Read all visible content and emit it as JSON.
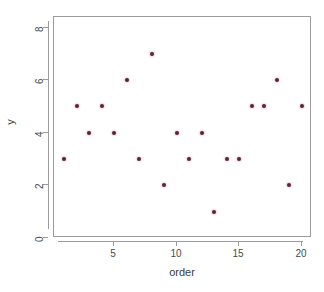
{
  "chart_data": {
    "type": "scatter",
    "title": "",
    "xlabel": "order",
    "ylabel": "y",
    "xlim": [
      0.2,
      20.8
    ],
    "ylim": [
      0,
      8.4
    ],
    "grid": false,
    "legend": null,
    "point_color": "#5e2239",
    "axis_color": "#9c9c9c",
    "background_color": "#ffffff",
    "x_ticks": [
      5,
      10,
      15,
      20
    ],
    "y_ticks": [
      0,
      2,
      4,
      6,
      8
    ],
    "x_tick_labels": [
      "5",
      "10",
      "15",
      "20"
    ],
    "y_tick_labels": [
      "0",
      "2",
      "4",
      "6",
      "8"
    ],
    "x": [
      1,
      2,
      3,
      4,
      5,
      6,
      7,
      8,
      9,
      10,
      11,
      12,
      13,
      14,
      15,
      16,
      17,
      18,
      19,
      20
    ],
    "y": [
      3,
      5,
      4,
      5,
      4,
      6,
      3,
      7,
      2,
      4,
      3,
      4,
      1,
      3,
      3,
      5,
      5,
      6,
      2,
      5
    ],
    "points": [
      {
        "x": 1,
        "y": 3
      },
      {
        "x": 2,
        "y": 5
      },
      {
        "x": 3,
        "y": 4
      },
      {
        "x": 4,
        "y": 5
      },
      {
        "x": 5,
        "y": 4
      },
      {
        "x": 6,
        "y": 6
      },
      {
        "x": 7,
        "y": 3
      },
      {
        "x": 8,
        "y": 7
      },
      {
        "x": 9,
        "y": 2
      },
      {
        "x": 10,
        "y": 4
      },
      {
        "x": 11,
        "y": 3
      },
      {
        "x": 12,
        "y": 4
      },
      {
        "x": 13,
        "y": 1
      },
      {
        "x": 14,
        "y": 3
      },
      {
        "x": 15,
        "y": 3
      },
      {
        "x": 16,
        "y": 5
      },
      {
        "x": 17,
        "y": 5
      },
      {
        "x": 18,
        "y": 6
      },
      {
        "x": 19,
        "y": 2
      },
      {
        "x": 20,
        "y": 5
      }
    ]
  }
}
